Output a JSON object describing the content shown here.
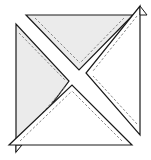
{
  "diagram": {
    "title": "",
    "colors": {
      "shaded_fill": "#ebebeb",
      "light_fill": "#ffffff",
      "outline": "#1a1a1a",
      "seam_line": "#7a7a7a"
    },
    "pieces": [
      {
        "id": "top",
        "fill": "shaded"
      },
      {
        "id": "left",
        "fill": "shaded"
      },
      {
        "id": "right",
        "fill": "light"
      },
      {
        "id": "bottom",
        "fill": "light"
      }
    ]
  }
}
